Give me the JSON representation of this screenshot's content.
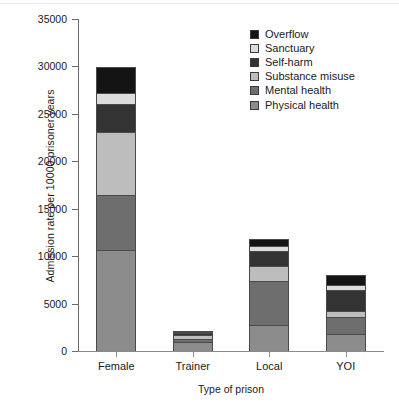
{
  "chart_data": {
    "type": "bar",
    "subtype": "stacked-bar",
    "title": "",
    "xlabel": "Type of prison",
    "ylabel": "Admission rate per 10000 prisoner years",
    "categories": [
      "Female",
      "Trainer",
      "Local",
      "YOI"
    ],
    "ylim": [
      0,
      35000
    ],
    "yticks": [
      0,
      5000,
      10000,
      15000,
      20000,
      25000,
      30000,
      35000
    ],
    "ytick_labels": [
      "0",
      "5000",
      "10000",
      "15000",
      "20000",
      "25000",
      "30000",
      "35000"
    ],
    "grid": false,
    "legend_position": "top-right",
    "series": [
      {
        "name": "Physical health",
        "color": "#8c8c8c",
        "values": [
          10650,
          900,
          2750,
          1800
        ]
      },
      {
        "name": "Mental health",
        "color": "#6e6e6e",
        "values": [
          5850,
          400,
          4600,
          1750
        ]
      },
      {
        "name": "Substance misuse",
        "color": "#bdbdbd",
        "values": [
          6600,
          400,
          1600,
          650
        ]
      },
      {
        "name": "Self-harm",
        "color": "#333333",
        "values": [
          2900,
          200,
          1550,
          2200
        ]
      },
      {
        "name": "Sanctuary",
        "color": "#dcdcdc",
        "values": [
          1250,
          150,
          550,
          600
        ]
      },
      {
        "name": "Overflow",
        "color": "#141414",
        "values": [
          2650,
          100,
          750,
          1050
        ]
      }
    ],
    "totals": [
      29900,
      2150,
      11800,
      8050
    ],
    "legend_order": [
      "Overflow",
      "Sanctuary",
      "Self-harm",
      "Substance misuse",
      "Mental health",
      "Physical health"
    ]
  },
  "legend": {
    "items": [
      {
        "label": "Overflow",
        "color": "#141414"
      },
      {
        "label": "Sanctuary",
        "color": "#dcdcdc"
      },
      {
        "label": "Self-harm",
        "color": "#333333"
      },
      {
        "label": "Substance misuse",
        "color": "#bdbdbd"
      },
      {
        "label": "Mental health",
        "color": "#6e6e6e"
      },
      {
        "label": "Physical health",
        "color": "#8c8c8c"
      }
    ]
  }
}
